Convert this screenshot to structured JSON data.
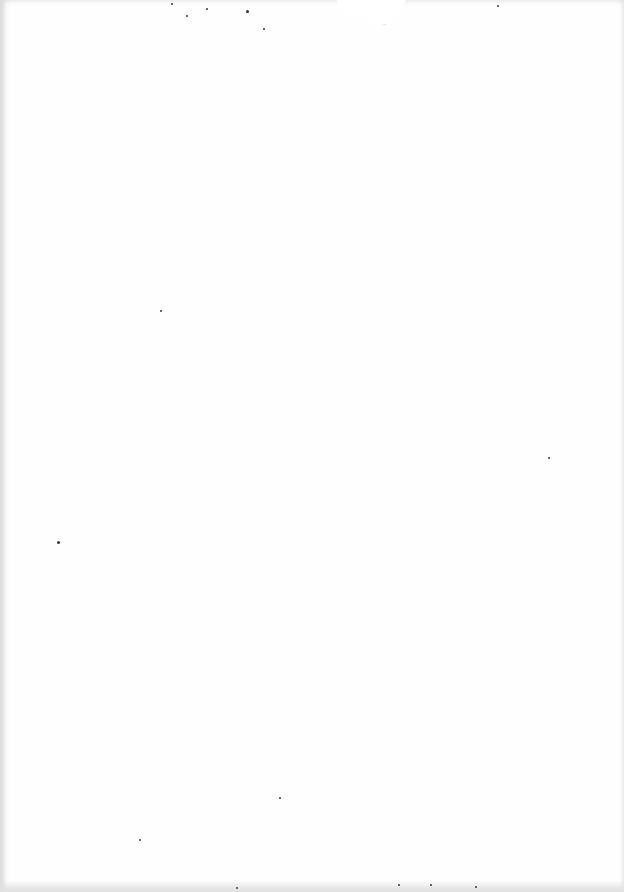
{
  "page": {
    "type": "blank scanned page",
    "text_content": ""
  },
  "specks": [
    {
      "x": 171,
      "y": 3,
      "size": 2
    },
    {
      "x": 206,
      "y": 8,
      "size": 2
    },
    {
      "x": 186,
      "y": 15,
      "size": 2
    },
    {
      "x": 263,
      "y": 28,
      "size": 2
    },
    {
      "x": 246,
      "y": 10,
      "size": 3
    },
    {
      "x": 497,
      "y": 5,
      "size": 2
    },
    {
      "x": 160,
      "y": 310,
      "size": 2
    },
    {
      "x": 548,
      "y": 457,
      "size": 2
    },
    {
      "x": 57,
      "y": 541,
      "size": 3
    },
    {
      "x": 279,
      "y": 797,
      "size": 2
    },
    {
      "x": 139,
      "y": 839,
      "size": 2
    },
    {
      "x": 430,
      "y": 884,
      "size": 2
    },
    {
      "x": 475,
      "y": 886,
      "size": 2
    },
    {
      "x": 398,
      "y": 884,
      "size": 2
    },
    {
      "x": 236,
      "y": 887,
      "size": 2
    }
  ]
}
